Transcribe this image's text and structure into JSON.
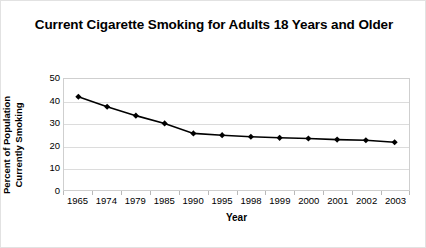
{
  "chart_data": {
    "type": "line",
    "title": "Current Cigarette Smoking for Adults 18 Years and Older",
    "xlabel": "Year",
    "ylabel": "Percent of Population Currently Smoking",
    "ylabel_line1": "Percent of Population",
    "ylabel_line2": "Currently Smoking",
    "categories": [
      "1965",
      "1974",
      "1979",
      "1985",
      "1990",
      "1995",
      "1998",
      "1999",
      "2000",
      "2001",
      "2002",
      "2003"
    ],
    "values": [
      42,
      37.5,
      33.5,
      30,
      25.5,
      24.7,
      24,
      23.5,
      23.2,
      22.7,
      22.4,
      21.5
    ],
    "ylim": [
      0,
      50
    ],
    "yticks": [
      50,
      40,
      30,
      20,
      10,
      0
    ],
    "grid": true,
    "legend": "none",
    "marker": "diamond",
    "series_color": "#000000",
    "gridline_color": "#dcdcdc",
    "frame_color": "#cfcfcf",
    "background_color": "#ffffff"
  }
}
